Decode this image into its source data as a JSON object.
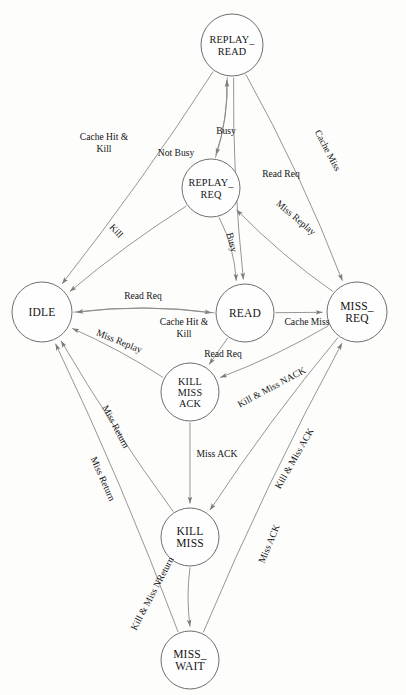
{
  "diagram": {
    "type": "state-machine",
    "background_color": "#fdfdfc",
    "node_stroke_color": "#6f6f6f",
    "edge_stroke_color": "#8a8a8a",
    "text_color": "#141414",
    "nodes": [
      {
        "id": "replay_read",
        "label_lines": [
          "REPLAY_",
          "READ"
        ],
        "cx": 232,
        "cy": 45,
        "r": 31
      },
      {
        "id": "replay_req",
        "label_lines": [
          "REPLAY_",
          "REQ"
        ],
        "cx": 211,
        "cy": 188,
        "r": 29
      },
      {
        "id": "idle",
        "label_lines": [
          "IDLE"
        ],
        "cx": 42,
        "cy": 312,
        "r": 30
      },
      {
        "id": "read",
        "label_lines": [
          "READ"
        ],
        "cx": 245,
        "cy": 313,
        "r": 29
      },
      {
        "id": "miss_req",
        "label_lines": [
          "MISS_",
          "REQ"
        ],
        "cx": 357,
        "cy": 312,
        "r": 30
      },
      {
        "id": "kill_miss_ack",
        "label_lines": [
          "KILL",
          "MISS",
          "ACK"
        ],
        "cx": 190,
        "cy": 392,
        "r": 29
      },
      {
        "id": "kill_miss",
        "label_lines": [
          "KILL",
          "MISS"
        ],
        "cx": 190,
        "cy": 537,
        "r": 29
      },
      {
        "id": "miss_wait",
        "label_lines": [
          "MISS_",
          "WAIT"
        ],
        "cx": 190,
        "cy": 660,
        "r": 29
      }
    ],
    "edges": [
      {
        "id": "e1",
        "from": "replay_read",
        "to": "idle",
        "label": "Cache Hit & Kill",
        "label_x": 104,
        "label_y": 140,
        "rotation": 0,
        "multiline": true
      },
      {
        "id": "e2",
        "from": "replay_read",
        "to": "replay_req",
        "label": "Busy",
        "label_x": 226,
        "label_y": 134,
        "rotation": 0,
        "multiline": false
      },
      {
        "id": "e3",
        "from": "replay_req",
        "to": "replay_read",
        "label": "Not Busy",
        "label_x": 176,
        "label_y": 156,
        "rotation": 0,
        "multiline": false
      },
      {
        "id": "e4",
        "from": "replay_read",
        "to": "read",
        "label": "Read Req",
        "label_x": 281,
        "label_y": 177,
        "rotation": 0,
        "multiline": false
      },
      {
        "id": "e5",
        "from": "replay_read",
        "to": "miss_req",
        "label": "Cache Miss",
        "label_x": 325,
        "label_y": 152,
        "rotation": 62,
        "multiline": false
      },
      {
        "id": "e6",
        "from": "replay_req",
        "to": "idle",
        "label": "Kill",
        "label_x": 114,
        "label_y": 233,
        "rotation": 47,
        "multiline": false
      },
      {
        "id": "e7",
        "from": "replay_req",
        "to": "read",
        "label": "Busy",
        "label_x": 229,
        "label_y": 243,
        "rotation": 76,
        "multiline": false
      },
      {
        "id": "e8",
        "from": "miss_req",
        "to": "replay_req",
        "label": "Miss Replay",
        "label_x": 294,
        "label_y": 220,
        "rotation": 40,
        "multiline": false
      },
      {
        "id": "e9",
        "from": "idle",
        "to": "read",
        "label": "Read Req",
        "label_x": 143,
        "label_y": 299,
        "rotation": 0,
        "multiline": false
      },
      {
        "id": "e10",
        "from": "read",
        "to": "idle",
        "label": "Cache Hit & Kill",
        "label_x": 184,
        "label_y": 325,
        "rotation": 0,
        "multiline": true
      },
      {
        "id": "e11",
        "from": "read",
        "to": "miss_req",
        "label": "Cache Miss",
        "label_x": 307,
        "label_y": 325,
        "rotation": 0,
        "multiline": false
      },
      {
        "id": "e12",
        "from": "kill_miss_ack",
        "to": "idle",
        "label": "Miss Replay",
        "label_x": 118,
        "label_y": 344,
        "rotation": 22,
        "multiline": false
      },
      {
        "id": "e13",
        "from": "read",
        "to": "kill_miss_ack",
        "label": "Read Req",
        "label_x": 223,
        "label_y": 357,
        "rotation": 0,
        "multiline": false
      },
      {
        "id": "e14",
        "from": "miss_req",
        "to": "kill_miss_ack",
        "label": "Kill & Miss NACK",
        "label_x": 273,
        "label_y": 390,
        "rotation": -28,
        "multiline": false
      },
      {
        "id": "e15",
        "from": "kill_miss_ack",
        "to": "kill_miss",
        "label": "Miss ACK",
        "label_x": 217,
        "label_y": 457,
        "rotation": 0,
        "multiline": false
      },
      {
        "id": "e16",
        "from": "miss_req",
        "to": "kill_miss",
        "label": "Kill & Miss ACK",
        "label_x": 297,
        "label_y": 460,
        "rotation": -60,
        "multiline": false
      },
      {
        "id": "e17",
        "from": "kill_miss",
        "to": "idle",
        "label": "Miss Return",
        "label_x": 113,
        "label_y": 428,
        "rotation": 62,
        "multiline": false
      },
      {
        "id": "e18",
        "from": "miss_wait",
        "to": "idle",
        "label": "Miss Return",
        "label_x": 100,
        "label_y": 480,
        "rotation": 66,
        "multiline": false
      },
      {
        "id": "e19",
        "from": "kill_miss",
        "to": "miss_wait",
        "label": "Kill & Miss NReturn",
        "label_x": 155,
        "label_y": 595,
        "rotation": -62,
        "multiline": false
      },
      {
        "id": "e20",
        "from": "miss_wait",
        "to": "miss_req",
        "label": "Miss ACK",
        "label_x": 272,
        "label_y": 545,
        "rotation": -67,
        "multiline": false
      }
    ]
  }
}
